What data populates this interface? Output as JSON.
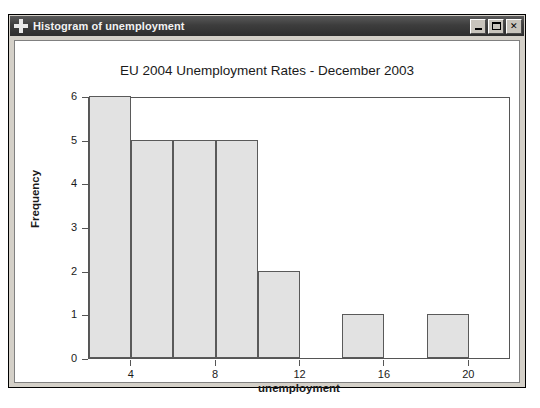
{
  "window": {
    "title": "Histogram of unemployment",
    "icon": "crosshair-plus-icon",
    "controls": {
      "minimize_label": "_",
      "maximize_label": "□",
      "close_label": "✕"
    }
  },
  "chart_data": {
    "type": "bar",
    "title": "EU 2004 Unemployment Rates - December 2003",
    "xlabel": "unemployment",
    "ylabel": "Frequency",
    "xlim": [
      2,
      22
    ],
    "ylim": [
      0,
      6
    ],
    "grid": false,
    "legend": null,
    "bin_width": 2,
    "bin_edges": [
      2,
      4,
      6,
      8,
      10,
      12,
      14,
      16,
      18,
      20,
      22
    ],
    "categories": [
      "2-4",
      "4-6",
      "6-8",
      "8-10",
      "10-12",
      "12-14",
      "14-16",
      "16-18",
      "18-20",
      "20-22"
    ],
    "values": [
      6,
      5,
      5,
      5,
      2,
      0,
      1,
      0,
      1,
      0
    ],
    "xticks": [
      4,
      8,
      12,
      16,
      20
    ],
    "xtick_labels": [
      "4",
      "8",
      "12",
      "16",
      "20"
    ],
    "yticks": [
      0,
      1,
      2,
      3,
      4,
      5,
      6
    ],
    "ytick_labels": [
      "0",
      "1",
      "2",
      "3",
      "4",
      "5",
      "6"
    ],
    "bar_fill_color": "#e2e2e2",
    "bar_border_color": "#5a5a5a",
    "axis_color": "#555555",
    "background_color": "#ffffff"
  }
}
